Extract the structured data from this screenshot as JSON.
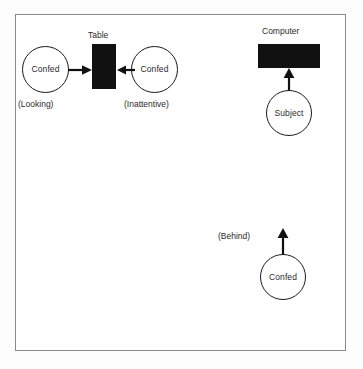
{
  "figure": {
    "room": {
      "name": "room-outline"
    },
    "objects": [
      {
        "id": "table",
        "title": "Table",
        "shape": "filled-rectangle",
        "color": "#111111"
      },
      {
        "id": "computer",
        "title": "Computer",
        "shape": "filled-rectangle",
        "color": "#111111"
      }
    ],
    "actors": [
      {
        "id": "confederate-looking",
        "label": "Confed",
        "caption": "(Looking)",
        "shape": "circle"
      },
      {
        "id": "confederate-inattentive",
        "label": "Confed",
        "caption": "(Inattentive)",
        "shape": "circle"
      },
      {
        "id": "subject",
        "label": "Subject",
        "caption": "",
        "shape": "circle"
      },
      {
        "id": "confederate-behind",
        "label": "Confed",
        "caption": "(Behind)",
        "shape": "circle"
      }
    ],
    "arrows": [
      {
        "id": "arrow-looking-to-table",
        "direction": "right",
        "from": "confederate-looking",
        "to": "table"
      },
      {
        "id": "arrow-inattentive-to-table",
        "direction": "left",
        "from": "confederate-inattentive",
        "to": "table"
      },
      {
        "id": "arrow-subject-to-computer",
        "direction": "up",
        "from": "subject",
        "to": "computer"
      },
      {
        "id": "arrow-behind-to-subject",
        "direction": "up",
        "from": "confederate-behind",
        "to": "subject"
      }
    ]
  }
}
